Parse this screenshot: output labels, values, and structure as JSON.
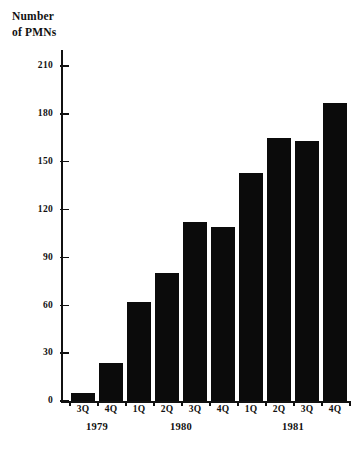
{
  "chart_data": {
    "type": "bar",
    "title": "Number\nof PMNs",
    "xlabel": "",
    "ylabel": "Number of PMNs",
    "categories": [
      "3Q",
      "4Q",
      "1Q",
      "2Q",
      "3Q",
      "4Q",
      "1Q",
      "2Q",
      "3Q",
      "4Q"
    ],
    "values": [
      5,
      24,
      62,
      80,
      112,
      109,
      143,
      165,
      163,
      187
    ],
    "group_labels": [
      "1979",
      "1980",
      "1981"
    ],
    "groups": [
      {
        "label": "1979",
        "categories": [
          "3Q",
          "4Q"
        ],
        "values": [
          5,
          24
        ]
      },
      {
        "label": "1980",
        "categories": [
          "1Q",
          "2Q",
          "3Q",
          "4Q"
        ],
        "values": [
          62,
          80,
          112,
          109
        ]
      },
      {
        "label": "1981",
        "categories": [
          "1Q",
          "2Q",
          "3Q",
          "4Q"
        ],
        "values": [
          143,
          165,
          163,
          187
        ]
      }
    ],
    "ylim": [
      0,
      220
    ],
    "yticks": [
      0,
      30,
      60,
      90,
      120,
      150,
      180,
      210
    ],
    "ytick_labels": [
      "0",
      "30",
      "60",
      "90",
      "120",
      "150",
      "180",
      "210"
    ],
    "grid": false,
    "legend": false,
    "bar_color": "#0b0b0b",
    "axis_color": "#111111",
    "background": "#ffffff"
  }
}
